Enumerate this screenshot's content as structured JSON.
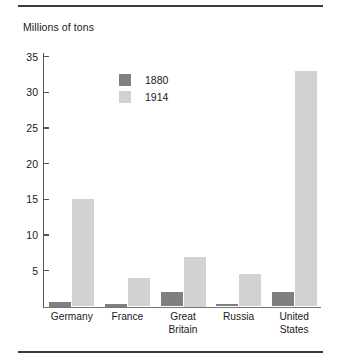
{
  "chart_data": {
    "type": "bar",
    "title": "Millions of tons",
    "xlabel": "",
    "ylabel": "Millions of tons",
    "ylim": [
      0,
      36.5
    ],
    "yticks": [
      5,
      10,
      15,
      20,
      25,
      30,
      35
    ],
    "grid": false,
    "legend_position": "inside-top-left",
    "categories": [
      "Germany",
      "France",
      "Great Britain",
      "Russia",
      "United States"
    ],
    "category_lines": [
      [
        "Germany"
      ],
      [
        "France"
      ],
      [
        "Great",
        "Britain"
      ],
      [
        "Russia"
      ],
      [
        "United",
        "States"
      ]
    ],
    "series": [
      {
        "name": "1880",
        "color": "#7f7f7f",
        "values": [
          0.7,
          0.35,
          2.0,
          0.3,
          2.0
        ]
      },
      {
        "name": "1914",
        "color": "#d2d2d2",
        "values": [
          15.0,
          4.0,
          7.0,
          4.5,
          33.0
        ]
      }
    ]
  },
  "axis": {
    "tick_labels": [
      "35",
      "30",
      "25",
      "20",
      "15",
      "10",
      "5"
    ],
    "tick_values": [
      35,
      30,
      25,
      20,
      15,
      10,
      5
    ]
  },
  "legend": {
    "items": [
      {
        "label": "1880",
        "color": "#7f7f7f"
      },
      {
        "label": "1914",
        "color": "#d2d2d2"
      }
    ]
  },
  "colors": {
    "series_1880": "#7f7f7f",
    "series_1914": "#d2d2d2",
    "axis": "#555555",
    "rule": "#3a3a3a",
    "text": "#1a1a1a",
    "background": "#ffffff"
  }
}
